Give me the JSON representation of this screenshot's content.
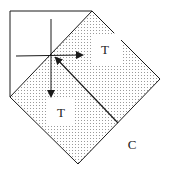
{
  "diagram": {
    "labels": {
      "upper_region": "T",
      "lower_region": "T",
      "corner": "C"
    },
    "colors": {
      "line": "#1a1a1a",
      "stipple": "#9a9a9a",
      "background": "#ffffff"
    }
  }
}
